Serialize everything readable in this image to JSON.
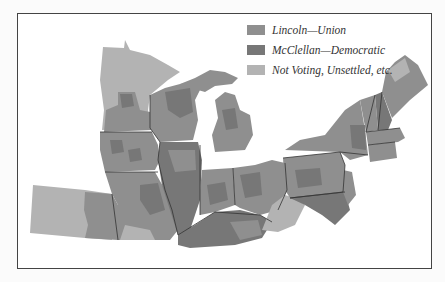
{
  "map": {
    "title": "",
    "regions": [
      "Minnesota",
      "Wisconsin",
      "Michigan",
      "Iowa",
      "Illinois",
      "Indiana",
      "Ohio",
      "Missouri",
      "Kentucky",
      "Kansas",
      "Pennsylvania",
      "New York",
      "Vermont",
      "New Hampshire",
      "Maine",
      "Massachusetts",
      "Connecticut",
      "Rhode Island",
      "New Jersey",
      "Delaware",
      "Maryland",
      "West Virginia"
    ]
  },
  "legend": {
    "items": [
      {
        "label": "Lincoln—Union",
        "color": "#8f8f8f"
      },
      {
        "label": "McClellan—Democratic",
        "color": "#777777"
      },
      {
        "label": "Not Voting, Unsettled, etc.",
        "color": "#b3b3b3"
      }
    ]
  },
  "colors": {
    "lincoln": "#8f8f8f",
    "mcclellan": "#777777",
    "not_voting": "#b3b3b3",
    "border": "#333333",
    "frame": "#444444"
  }
}
